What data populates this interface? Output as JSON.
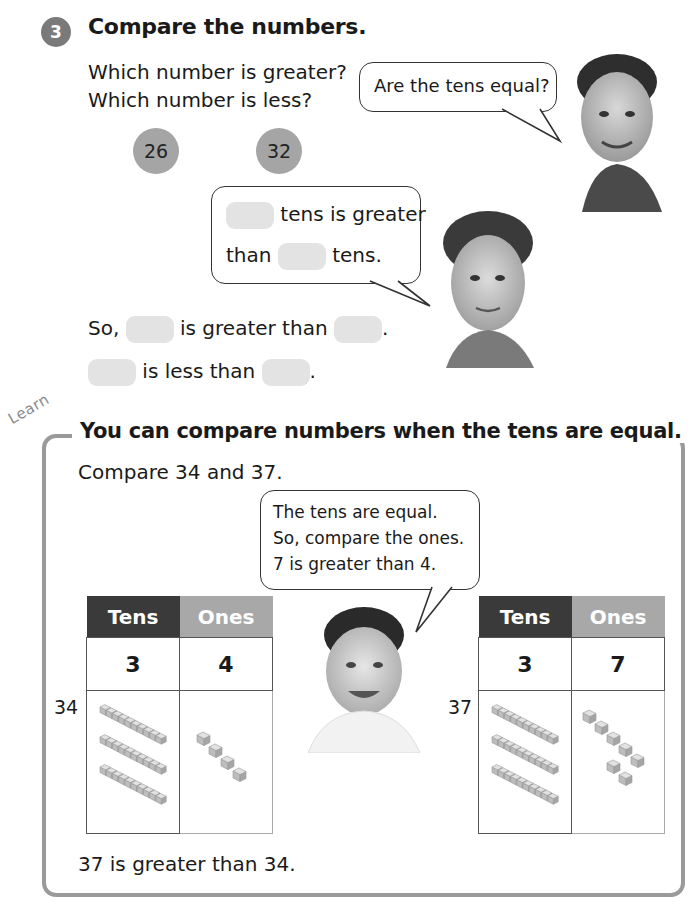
{
  "question": {
    "number": "3",
    "title": "Compare the numbers.",
    "prompt_line1": "Which number is greater?",
    "prompt_line2": "Which number is less?",
    "numbers": [
      "26",
      "32"
    ],
    "bubble_girl": "Are the tens equal?",
    "bubble_boy": {
      "line1_after_blank": "tens is greater",
      "line2_before_blank": "than",
      "line2_after_blank": "tens."
    },
    "so_line": {
      "prefix": "So,",
      "middle": "is greater than",
      "end": "."
    },
    "less_line": {
      "middle": "is less than",
      "end": "."
    }
  },
  "learn": {
    "tag": "Learn",
    "title": "You can compare numbers when the tens are equal.",
    "instruction": "Compare 34 and 37.",
    "bubble": {
      "line1": "The tens are equal.",
      "line2": "So, compare the ones.",
      "line3": "7 is greater than 4."
    },
    "tables": [
      {
        "label": "34",
        "header_tens": "Tens",
        "header_ones": "Ones",
        "tens": "3",
        "ones": "4",
        "tens_rods": 3,
        "ones_cubes": 4
      },
      {
        "label": "37",
        "header_tens": "Tens",
        "header_ones": "Ones",
        "tens": "3",
        "ones": "7",
        "tens_rods": 3,
        "ones_cubes": 7
      }
    ],
    "conclusion": "37 is greater than 34."
  },
  "colors": {
    "dark_header": "#3a3a3a",
    "light_header": "#a8a8a8",
    "number_circle": "#a5a5a5",
    "blank_fill": "#e3e3e3",
    "frame": "#9a9a9a"
  }
}
